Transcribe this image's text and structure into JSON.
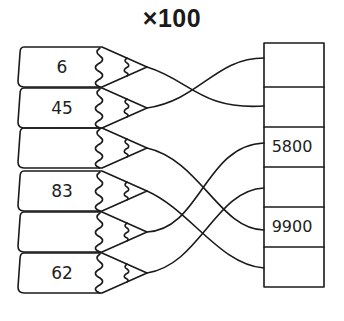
{
  "title": "×100",
  "pencils": [
    {
      "label": "6"
    },
    {
      "label": "45"
    },
    {
      "label": ""
    },
    {
      "label": "83"
    },
    {
      "label": ""
    },
    {
      "label": "62"
    }
  ],
  "boxes": [
    {
      "label": ""
    },
    {
      "label": ""
    },
    {
      "label": "5800"
    },
    {
      "label": ""
    },
    {
      "label": "9900"
    },
    {
      "label": ""
    }
  ],
  "connections": [
    {
      "pencil": 0,
      "box": 1
    },
    {
      "pencil": 1,
      "box": 0
    },
    {
      "pencil": 2,
      "box": 4
    },
    {
      "pencil": 3,
      "box": 5
    },
    {
      "pencil": 4,
      "box": 2
    },
    {
      "pencil": 5,
      "box": 3
    }
  ],
  "colors": {
    "stroke": "#1a1a1a",
    "background": "#ffffff"
  }
}
